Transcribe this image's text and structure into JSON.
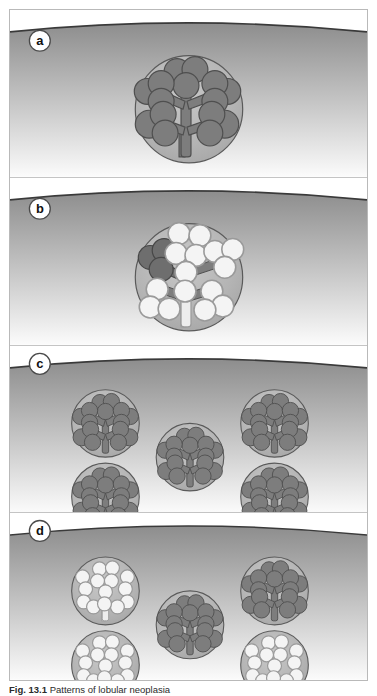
{
  "figure": {
    "caption_label": "Fig. 13.1",
    "caption_text": "Patterns of lobular neoplasia",
    "caption_full": "Fig. 13.1 Patterns of lobular neoplasia",
    "frame_border_color": "#b9b9b9",
    "background_color": "#ffffff"
  },
  "colors": {
    "tissue_top": "#8d8d8d",
    "tissue_bottom": "#fbfbfb",
    "surface_line": "#3a3a3a",
    "lobule_halo": "#b4b4b4",
    "lobule_outline": "#5a5a5a",
    "acinus_dark": "#7d7d7d",
    "acinus_dark_outline": "#4f4f4f",
    "acinus_pale": "#f4f4f4",
    "acinus_pale_outline": "#9a9a9a",
    "duct_fill": "#ededed",
    "badge_fill": "#ffffff",
    "badge_outline": "#4a4a4a",
    "badge_text": "#111111",
    "panel_divider": "#c4c4c4"
  },
  "panels": [
    {
      "id": "panel-a",
      "label": "a",
      "description": "Single normal terminal duct lobular unit with dark branching acini",
      "lobule_count": 1,
      "neoplastic_lobule_count": 0,
      "layout": "single-large-center",
      "lobules": [
        {
          "name": "central-lobule",
          "state": "normal",
          "cx": 180,
          "cy": 100,
          "r": 54,
          "neoplastic": false
        }
      ]
    },
    {
      "id": "panel-b",
      "label": "b",
      "description": "Single lobule largely replaced by pale distended neoplastic acini, one residual dark acinar cluster remains",
      "lobule_count": 1,
      "neoplastic_lobule_count": 1,
      "layout": "single-large-center",
      "lobules": [
        {
          "name": "central-lobule",
          "state": "neoplastic",
          "cx": 180,
          "cy": 100,
          "r": 54,
          "neoplastic": true,
          "residual_dark_cluster": true
        }
      ]
    },
    {
      "id": "panel-c",
      "label": "c",
      "description": "Five normal lobules distributed across the tissue, quincunx arrangement",
      "lobule_count": 5,
      "neoplastic_lobule_count": 0,
      "layout": "quincunx",
      "lobules": [
        {
          "name": "lobule-top-left",
          "state": "normal",
          "cx": 96,
          "cy": 78,
          "r": 34,
          "neoplastic": false
        },
        {
          "name": "lobule-top-right",
          "state": "normal",
          "cx": 266,
          "cy": 78,
          "r": 34,
          "neoplastic": false
        },
        {
          "name": "lobule-center",
          "state": "normal",
          "cx": 181,
          "cy": 119,
          "r": 34,
          "neoplastic": false
        },
        {
          "name": "lobule-bottom-left",
          "state": "normal",
          "cx": 96,
          "cy": 158,
          "r": 34,
          "neoplastic": false
        },
        {
          "name": "lobule-bottom-right",
          "state": "normal",
          "cx": 266,
          "cy": 158,
          "r": 34,
          "neoplastic": false
        }
      ]
    },
    {
      "id": "panel-d",
      "label": "d",
      "description": "Multifocal lobular neoplasia: three lobules contain pale distended acini while two lobules remain normal",
      "lobule_count": 5,
      "neoplastic_lobule_count": 3,
      "layout": "quincunx",
      "lobules": [
        {
          "name": "lobule-top-left",
          "state": "neoplastic",
          "cx": 96,
          "cy": 78,
          "r": 34,
          "neoplastic": true,
          "residual_dark_cluster": false
        },
        {
          "name": "lobule-top-right",
          "state": "normal",
          "cx": 266,
          "cy": 78,
          "r": 34,
          "neoplastic": false
        },
        {
          "name": "lobule-center",
          "state": "normal",
          "cx": 181,
          "cy": 119,
          "r": 34,
          "neoplastic": false
        },
        {
          "name": "lobule-bottom-left",
          "state": "neoplastic",
          "cx": 96,
          "cy": 158,
          "r": 34,
          "neoplastic": true,
          "residual_dark_cluster": false
        },
        {
          "name": "lobule-bottom-right",
          "state": "neoplastic",
          "cx": 266,
          "cy": 158,
          "r": 34,
          "neoplastic": true,
          "residual_dark_cluster": false
        }
      ]
    }
  ]
}
